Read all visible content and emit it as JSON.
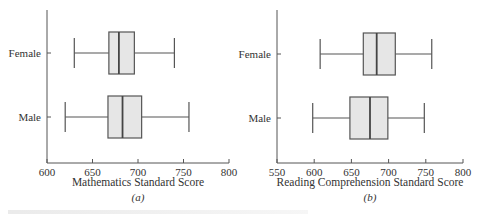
{
  "chart_data": [
    {
      "type": "boxplot",
      "panel": "(a)",
      "title": "",
      "xlabel": "Mathematics Standard Score",
      "ylabel": "",
      "xlim": [
        600,
        800
      ],
      "xticks": [
        600,
        650,
        700,
        750,
        800
      ],
      "categories": [
        "Female",
        "Male"
      ],
      "series": [
        {
          "name": "Female",
          "min": 630,
          "q1": 668,
          "median": 679,
          "q3": 696,
          "max": 740
        },
        {
          "name": "Male",
          "min": 620,
          "q1": 667,
          "median": 683,
          "q3": 704,
          "max": 756
        }
      ],
      "grid": false
    },
    {
      "type": "boxplot",
      "panel": "(b)",
      "title": "",
      "xlabel": "Reading Comprehension Standard Score",
      "ylabel": "",
      "xlim": [
        550,
        800
      ],
      "xticks": [
        550,
        600,
        650,
        700,
        750,
        800
      ],
      "categories": [
        "Female",
        "Male"
      ],
      "series": [
        {
          "name": "Female",
          "min": 608,
          "q1": 666,
          "median": 684,
          "q3": 709,
          "max": 758
        },
        {
          "name": "Male",
          "min": 598,
          "q1": 648,
          "median": 675,
          "q3": 699,
          "max": 748
        }
      ],
      "grid": false
    }
  ]
}
